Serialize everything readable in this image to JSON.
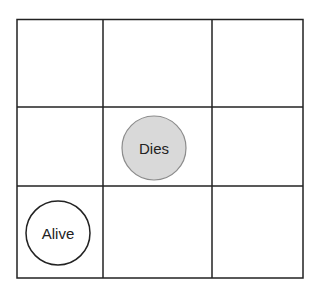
{
  "diagram": {
    "type": "grid-3x3",
    "grid": {
      "rows": 3,
      "cols": 3,
      "line_color": "#222222"
    },
    "cells": [
      {
        "row": 1,
        "col": 1,
        "content": ""
      },
      {
        "row": 1,
        "col": 2,
        "content": "Dies",
        "shape": "circle",
        "fill": "#d9d9d9",
        "stroke": "#888888"
      },
      {
        "row": 2,
        "col": 0,
        "content": "Alive",
        "shape": "circle",
        "fill": "#ffffff",
        "stroke": "#222222"
      }
    ],
    "labels": {
      "dies": "Dies",
      "alive": "Alive"
    },
    "colors": {
      "dies_fill": "#d9d9d9",
      "dies_stroke": "#8c8c8c",
      "alive_fill": "#ffffff",
      "alive_stroke": "#222222"
    }
  }
}
